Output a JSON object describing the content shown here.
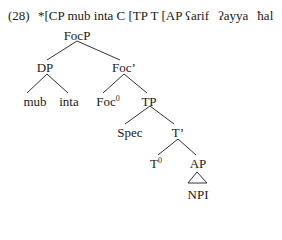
{
  "example": {
    "number": "(28)",
    "bracketed_string": "*[CP mub inta C [TP T [AP",
    "words": [
      "ʕarif",
      "ʔayya",
      "ħal"
    ]
  },
  "tree": {
    "root": "FocP",
    "nodes": {
      "focp": "FocP",
      "dp": "DP",
      "mub": "mub",
      "inta": "inta",
      "foc_bar": "Foc’",
      "foc0_base": "Foc",
      "foc0_sup": "0",
      "tp": "TP",
      "spec": "Spec",
      "t_bar": "T’",
      "t0_base": "T",
      "t0_sup": "0",
      "ap": "AP",
      "npi": "NPI"
    },
    "structure": [
      {
        "parent": "FocP",
        "children": [
          "DP",
          "Foc’"
        ]
      },
      {
        "parent": "DP",
        "children": [
          "mub",
          "inta"
        ]
      },
      {
        "parent": "Foc’",
        "children": [
          "Foc0",
          "TP"
        ]
      },
      {
        "parent": "TP",
        "children": [
          "Spec",
          "T’"
        ]
      },
      {
        "parent": "T’",
        "children": [
          "T0",
          "AP"
        ]
      },
      {
        "parent": "AP",
        "children": [
          "NPI"
        ],
        "triangle": true
      }
    ],
    "line_color": "#333333"
  }
}
